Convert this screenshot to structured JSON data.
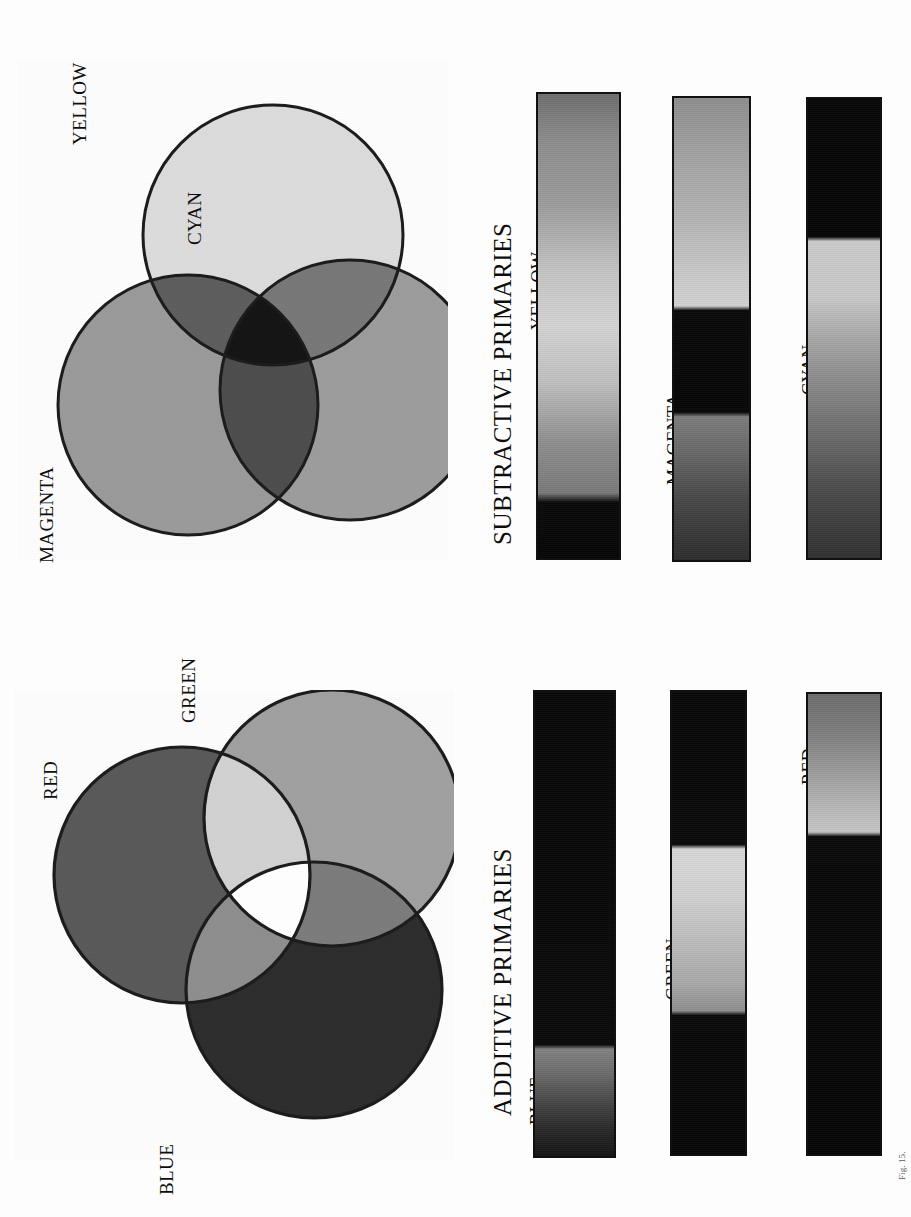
{
  "page": {
    "background_color": "#fdfdfd",
    "orientation": "rotated-90",
    "caption": "Fig. 15."
  },
  "subtractive": {
    "title": "SUBTRACTIVE PRIMARIES",
    "venn": {
      "name": "subtractive-venn",
      "circles": [
        {
          "label": "YELLOW",
          "fill": "#dcdcdc",
          "cx": 255,
          "cy": 175,
          "r": 130
        },
        {
          "label": "CYAN",
          "fill": "#9c9c9c",
          "cx": 332,
          "cy": 330,
          "r": 130
        },
        {
          "label": "MAGENTA",
          "fill": "#9a9a9a",
          "cx": 170,
          "cy": 345,
          "r": 130
        }
      ],
      "overlaps": [
        {
          "name": "yellow-cyan",
          "fill": "#787878"
        },
        {
          "name": "yellow-magenta",
          "fill": "#5a5a5a"
        },
        {
          "name": "cyan-magenta",
          "fill": "#4a4a4a"
        },
        {
          "name": "all-three",
          "fill": "#141414"
        }
      ],
      "stroke": "#1b1b1b",
      "stroke_width": 3
    },
    "bars": [
      {
        "label": "YELLOW",
        "name": "yellow-gradient-bar",
        "stops": [
          {
            "pos": 0,
            "color": "#6f6f6f"
          },
          {
            "pos": 10,
            "color": "#8d8d8d"
          },
          {
            "pos": 24,
            "color": "#9d9d9d"
          },
          {
            "pos": 38,
            "color": "#c4c4c4"
          },
          {
            "pos": 50,
            "color": "#d4d4d4"
          },
          {
            "pos": 62,
            "color": "#c0c0c0"
          },
          {
            "pos": 75,
            "color": "#8f8f8f"
          },
          {
            "pos": 86,
            "color": "#7a7a7a"
          },
          {
            "pos": 88,
            "color": "#0a0a0a"
          },
          {
            "pos": 100,
            "color": "#070707"
          }
        ]
      },
      {
        "label": "MAGENTA",
        "name": "magenta-gradient-bar",
        "stops": [
          {
            "pos": 0,
            "color": "#8f8f8f"
          },
          {
            "pos": 12,
            "color": "#a2a2a2"
          },
          {
            "pos": 26,
            "color": "#b4b4b4"
          },
          {
            "pos": 38,
            "color": "#c9c9c9"
          },
          {
            "pos": 45,
            "color": "#d2d2d2"
          },
          {
            "pos": 46,
            "color": "#0a0a0a"
          },
          {
            "pos": 68,
            "color": "#070707"
          },
          {
            "pos": 69,
            "color": "#7d7d7d"
          },
          {
            "pos": 76,
            "color": "#6b6b6b"
          },
          {
            "pos": 86,
            "color": "#4b4b4b"
          },
          {
            "pos": 100,
            "color": "#2e2e2e"
          }
        ]
      },
      {
        "label": "CYAN",
        "name": "cyan-gradient-bar",
        "stops": [
          {
            "pos": 0,
            "color": "#080808"
          },
          {
            "pos": 30,
            "color": "#070707"
          },
          {
            "pos": 31,
            "color": "#cbcbcb"
          },
          {
            "pos": 43,
            "color": "#c9c9c9"
          },
          {
            "pos": 52,
            "color": "#a8a8a8"
          },
          {
            "pos": 62,
            "color": "#8a8a8a"
          },
          {
            "pos": 74,
            "color": "#6a6a6a"
          },
          {
            "pos": 86,
            "color": "#4a4a4a"
          },
          {
            "pos": 100,
            "color": "#323232"
          }
        ]
      }
    ]
  },
  "additive": {
    "title": "ADDITIVE PRIMARIES",
    "venn": {
      "name": "additive-venn",
      "circles": [
        {
          "label": "RED",
          "fill": "#595959",
          "cx": 168,
          "cy": 185,
          "r": 128
        },
        {
          "label": "GREEN",
          "fill": "#a0a0a0",
          "cx": 318,
          "cy": 128,
          "r": 128
        },
        {
          "label": "BLUE",
          "fill": "#2d2d2d",
          "cx": 300,
          "cy": 300,
          "r": 128
        }
      ],
      "overlaps": [
        {
          "name": "red-green",
          "fill": "#d2d2d2"
        },
        {
          "name": "red-blue",
          "fill": "#8e8e8e"
        },
        {
          "name": "green-blue",
          "fill": "#7c7c7c"
        },
        {
          "name": "all-three",
          "fill": "#ffffff"
        }
      ],
      "stroke": "#1b1b1b",
      "stroke_width": 3
    },
    "bars": [
      {
        "label": "BLUE",
        "name": "blue-gradient-bar",
        "stops": [
          {
            "pos": 0,
            "color": "#090909"
          },
          {
            "pos": 76,
            "color": "#0a0a0a"
          },
          {
            "pos": 77,
            "color": "#838383"
          },
          {
            "pos": 82,
            "color": "#6d6d6d"
          },
          {
            "pos": 88,
            "color": "#4a4a4a"
          },
          {
            "pos": 94,
            "color": "#2b2b2b"
          },
          {
            "pos": 100,
            "color": "#161616"
          }
        ]
      },
      {
        "label": "GREEN",
        "name": "green-gradient-bar",
        "stops": [
          {
            "pos": 0,
            "color": "#090909"
          },
          {
            "pos": 33,
            "color": "#0a0a0a"
          },
          {
            "pos": 34,
            "color": "#d8d8d8"
          },
          {
            "pos": 44,
            "color": "#d2d2d2"
          },
          {
            "pos": 54,
            "color": "#bdbdbd"
          },
          {
            "pos": 63,
            "color": "#a9a9a9"
          },
          {
            "pos": 69,
            "color": "#8f8f8f"
          },
          {
            "pos": 70,
            "color": "#0a0a0a"
          },
          {
            "pos": 100,
            "color": "#080808"
          }
        ]
      },
      {
        "label": "RED",
        "name": "red-gradient-bar",
        "stops": [
          {
            "pos": 0,
            "color": "#6e6e6e"
          },
          {
            "pos": 8,
            "color": "#7d7d7d"
          },
          {
            "pos": 16,
            "color": "#999999"
          },
          {
            "pos": 24,
            "color": "#b6b6b6"
          },
          {
            "pos": 30,
            "color": "#c6c6c6"
          },
          {
            "pos": 31,
            "color": "#0a0a0a"
          },
          {
            "pos": 100,
            "color": "#070707"
          }
        ]
      }
    ]
  }
}
